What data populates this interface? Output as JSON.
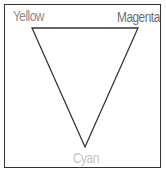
{
  "diagram": {
    "type": "color-triangle",
    "labels": {
      "top_left": "Yellow",
      "top_right": "Magenta",
      "bottom": "Cyan"
    },
    "vertices": {
      "yellow": [
        32,
        28
      ],
      "magenta": [
        138,
        28
      ],
      "cyan": [
        85,
        147
      ]
    },
    "colors": {
      "border": "#333333",
      "triangle_stroke": "#333333",
      "yellow_label": "#8a8a8a",
      "magenta_label": "#6f6f6f",
      "cyan_label": "#c4c4c4"
    }
  }
}
